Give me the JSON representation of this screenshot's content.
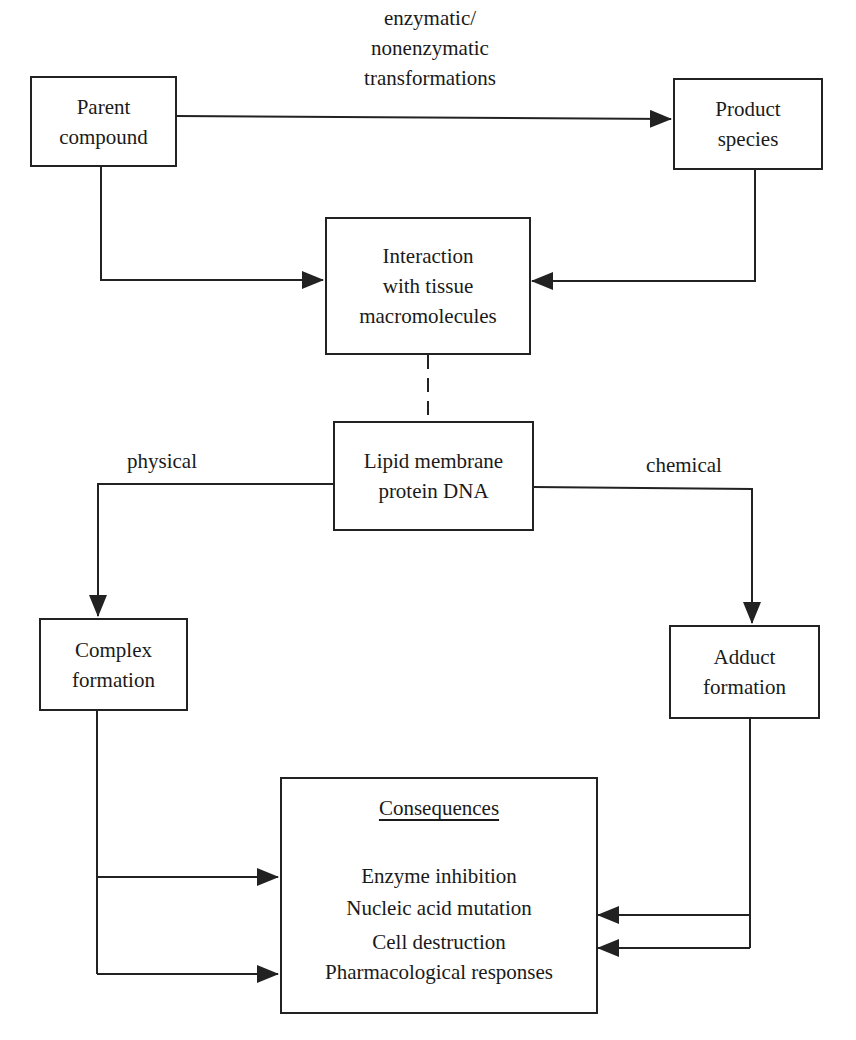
{
  "diagram": {
    "nodes": {
      "parent": {
        "lines": [
          "Parent",
          "compound"
        ]
      },
      "product": {
        "lines": [
          "Product",
          "species"
        ]
      },
      "interaction": {
        "lines": [
          "Interaction",
          "with tissue",
          "macromolecules"
        ]
      },
      "lipid": {
        "lines": [
          "Lipid membrane",
          "protein DNA"
        ]
      },
      "complex": {
        "lines": [
          "Complex",
          "formation"
        ]
      },
      "adduct": {
        "lines": [
          "Adduct",
          "formation"
        ]
      },
      "consequences": {
        "title": "Consequences",
        "items": [
          "Enzyme inhibition",
          "Nucleic acid mutation",
          "Cell destruction",
          "Pharmacological responses"
        ]
      }
    },
    "edge_labels": {
      "transform": [
        "enzymatic/",
        "nonenzymatic",
        "transformations"
      ],
      "physical": "physical",
      "chemical": "chemical"
    },
    "edges": [
      {
        "from": "parent",
        "to": "product",
        "label": "enzymatic/ nonenzymatic transformations"
      },
      {
        "from": "parent",
        "to": "interaction"
      },
      {
        "from": "product",
        "to": "interaction"
      },
      {
        "from": "interaction",
        "to": "lipid",
        "style": "dashed"
      },
      {
        "from": "lipid",
        "to": "complex",
        "label": "physical"
      },
      {
        "from": "lipid",
        "to": "adduct",
        "label": "chemical"
      },
      {
        "from": "complex",
        "to": "consequences",
        "count": 2
      },
      {
        "from": "adduct",
        "to": "consequences",
        "count": 2
      }
    ],
    "colors": {
      "stroke": "#222222",
      "background": "#ffffff",
      "text": "#1a1a1a"
    }
  }
}
